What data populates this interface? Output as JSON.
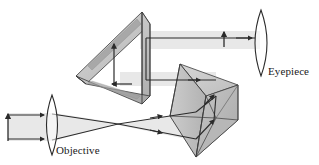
{
  "figure": {
    "type": "optical-ray-diagram",
    "width": 319,
    "height": 165,
    "background_color": "#ffffff"
  },
  "labels": {
    "objective": "Objective",
    "eyepiece": "Eyepiece"
  },
  "components": {
    "objective_lens": {
      "name": "Objective",
      "shape": "biconvex-lens",
      "center_x": 52,
      "center_y": 125,
      "half_height": 30,
      "half_width": 9
    },
    "eyepiece_lens": {
      "name": "Eyepiece",
      "shape": "biconvex-lens",
      "center_x": 261,
      "center_y": 43,
      "half_height": 33,
      "half_width": 10
    },
    "upper_prism": {
      "name": "Upper Porro prism",
      "orientation": "horizontal-roof",
      "fill": "#c3c3c3"
    },
    "lower_prism": {
      "name": "Lower Porro prism",
      "orientation": "vertical-roof",
      "fill": "#c3c3c3"
    },
    "object_arrow": {
      "name": "Object arrow",
      "direction": "up",
      "x": 8,
      "y_top": 113,
      "y_bottom": 140
    },
    "intermediate_image_arrow": {
      "name": "Intermediate image arrow",
      "direction": "up",
      "x": 224,
      "y_top": 33,
      "y_bottom": 47
    },
    "prism_image_arrow_up": {
      "name": "Erected image arrow inside upper prism",
      "direction": "up"
    },
    "prism_image_arrow_left": {
      "name": "Inverted image arrow at prism base",
      "direction": "left"
    }
  },
  "colors": {
    "ray_stroke": "#2b2b2b",
    "beam_fill": "#e3e3e3",
    "beam_core": "#cfcfcf",
    "prism_face_light": "#cfcfcf",
    "prism_face_mid": "#bcbcbc",
    "prism_face_dark": "#a8a8a8",
    "prism_edge": "#3a3a3a",
    "text": "#1a1a1a"
  },
  "optics": {
    "ray_count": 2,
    "focus_point": {
      "x": 118,
      "y": 124
    },
    "beam_paths": [
      "object -> objective lens",
      "objective -> lower prism",
      "lower prism -> upper prism",
      "upper prism -> eyepiece"
    ]
  }
}
